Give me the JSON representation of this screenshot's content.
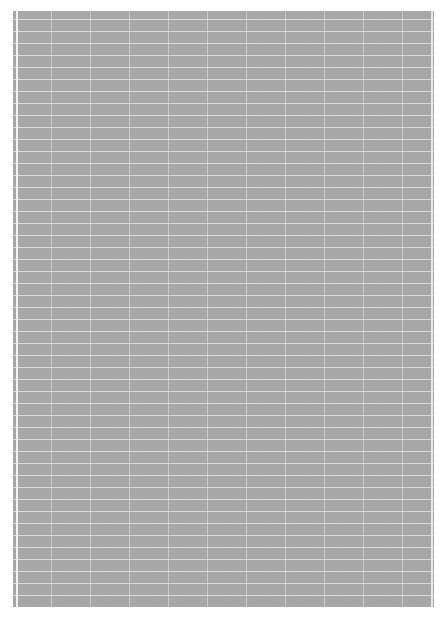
{
  "sheet": {
    "description": "gray grid-ruled paper texture",
    "background_color": "#a9a9a9",
    "line_color": "#ebebeb",
    "horizontal_line_spacing_px": 12,
    "vertical_line_spacing_px": 39
  }
}
